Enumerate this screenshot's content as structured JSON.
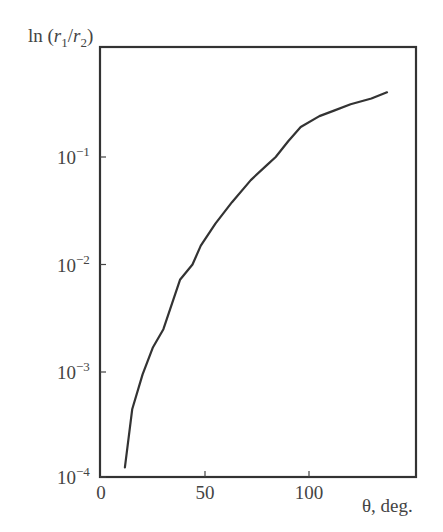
{
  "chart_data": {
    "type": "line",
    "title": "",
    "xlabel": "θ, deg.",
    "ylabel": "ln (r1/r2)",
    "ylabel_parts": {
      "prefix": "ln (",
      "r1": "r",
      "sub1": "1",
      "slash": "/",
      "r2": "r",
      "sub2": "2",
      "suffix": ")"
    },
    "yscale": "log",
    "xlim": [
      0,
      151
    ],
    "ylim": [
      0.0001,
      1.05
    ],
    "grid": false,
    "legend": null,
    "x_ticks": [
      {
        "value": 0,
        "label": "0"
      },
      {
        "value": 50,
        "label": "50"
      },
      {
        "value": 100,
        "label": "100"
      }
    ],
    "y_ticks": [
      {
        "value": 0.0001,
        "base": "10",
        "exp": "−4"
      },
      {
        "value": 0.001,
        "base": "10",
        "exp": "−3"
      },
      {
        "value": 0.01,
        "base": "10",
        "exp": "−2"
      },
      {
        "value": 0.1,
        "base": "10",
        "exp": "−1"
      }
    ],
    "series": [
      {
        "name": "ln(r1/r2)",
        "color": "#333333",
        "x": [
          11.5,
          15,
          20,
          25,
          30,
          38,
          44,
          48,
          55,
          63,
          72,
          80,
          84,
          90,
          96,
          105,
          112,
          120,
          130,
          137.5
        ],
        "y": [
          0.00013,
          0.00045,
          0.00095,
          0.0017,
          0.0025,
          0.0072,
          0.01,
          0.015,
          0.024,
          0.038,
          0.061,
          0.085,
          0.1,
          0.14,
          0.19,
          0.24,
          0.27,
          0.31,
          0.35,
          0.4
        ]
      }
    ]
  }
}
